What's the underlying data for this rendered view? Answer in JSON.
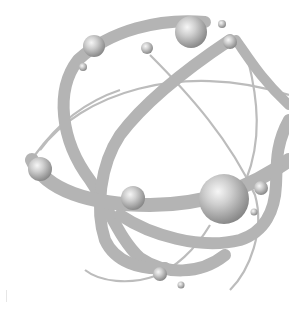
{
  "image": {
    "subject": "atom-illustration",
    "alt": "Grayscale atom model with intersecting orbit bands and shaded spheres",
    "colors": {
      "background": "#ffffff",
      "orbit_band": "#b4b4b4",
      "orbit_line": "#b8b8b8",
      "sphere_highlight": "#f4f4f4",
      "sphere_mid": "#b8b8b8",
      "sphere_shadow": "#7a7a7a"
    },
    "spheres": [
      {
        "cx": 94,
        "cy": 46,
        "r": 11
      },
      {
        "cx": 83,
        "cy": 67,
        "r": 4
      },
      {
        "cx": 147,
        "cy": 48,
        "r": 6
      },
      {
        "cx": 191,
        "cy": 32,
        "r": 16
      },
      {
        "cx": 222,
        "cy": 24,
        "r": 4
      },
      {
        "cx": 230,
        "cy": 42,
        "r": 7
      },
      {
        "cx": 40,
        "cy": 169,
        "r": 12
      },
      {
        "cx": 133,
        "cy": 198,
        "r": 12
      },
      {
        "cx": 224,
        "cy": 199,
        "r": 25
      },
      {
        "cx": 261,
        "cy": 188,
        "r": 7
      },
      {
        "cx": 254,
        "cy": 212,
        "r": 3.5
      },
      {
        "cx": 160,
        "cy": 274,
        "r": 7
      },
      {
        "cx": 181,
        "cy": 285,
        "r": 3.5
      }
    ]
  }
}
